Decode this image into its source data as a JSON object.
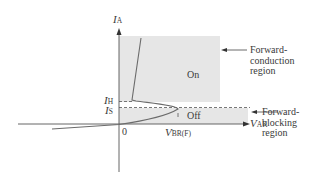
{
  "diagram": {
    "axes": {
      "y_label": {
        "main": "I",
        "sub": "A"
      },
      "x_label": {
        "main": "V",
        "sub": "AK"
      },
      "origin": "0"
    },
    "levels": {
      "holding": {
        "main": "I",
        "sub": "H"
      },
      "switching": {
        "main": "I",
        "sub": "S"
      },
      "breakover": {
        "main": "V",
        "sub": "BR(F)"
      }
    },
    "regions": {
      "on": "On",
      "off": "Off"
    },
    "callouts": {
      "forward_conduction": [
        "Forward-",
        "conduction",
        "region"
      ],
      "forward_blocking": [
        "Forward-",
        "blocking",
        "region"
      ]
    },
    "colors": {
      "region_fill": "#e6e6e6",
      "curve": "#6b6b6b",
      "axis": "#555555"
    }
  }
}
